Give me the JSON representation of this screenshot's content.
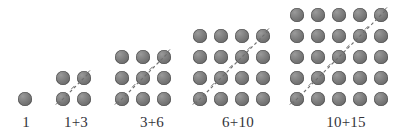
{
  "figure": {
    "background_color": "#ffffff",
    "dot_color": "#7f7f7f",
    "dot_edge_color": "#565656",
    "diagonal_color": "#6f6f6f",
    "label_color": "#33333a",
    "dot_pitch_px": 21,
    "dot_diameter_px": 14,
    "baseline_center_y_px": 99,
    "groups": [
      {
        "index": 1,
        "label": "1",
        "grid_size": 1,
        "dot_count": 1,
        "triangular_parts": [
          1
        ],
        "has_diagonal": false,
        "origin_x": 25,
        "label_left": 10,
        "label_width": 32
      },
      {
        "index": 2,
        "label": "1+3",
        "grid_size": 2,
        "dot_count": 4,
        "triangular_parts": [
          1,
          3
        ],
        "has_diagonal": true,
        "origin_x": 63,
        "label_left": 56,
        "label_width": 40
      },
      {
        "index": 3,
        "label": "3+6",
        "grid_size": 3,
        "dot_count": 9,
        "triangular_parts": [
          3,
          6
        ],
        "has_diagonal": true,
        "origin_x": 122,
        "label_left": 122,
        "label_width": 60
      },
      {
        "index": 4,
        "label": "6+10",
        "grid_size": 4,
        "dot_count": 16,
        "triangular_parts": [
          6,
          10
        ],
        "has_diagonal": true,
        "origin_x": 200,
        "label_left": 196,
        "label_width": 84
      },
      {
        "index": 5,
        "label": "10+15",
        "grid_size": 5,
        "dot_count": 25,
        "triangular_parts": [
          10,
          15
        ],
        "has_diagonal": true,
        "origin_x": 297,
        "label_left": 291,
        "label_width": 110
      }
    ]
  },
  "chart_data": {
    "type": "scatter",
    "xlabel": "",
    "ylabel": "",
    "categories": [
      "1",
      "1+3",
      "3+6",
      "6+10",
      "10+15"
    ],
    "values": [
      1,
      4,
      9,
      16,
      25
    ],
    "series": [
      {
        "name": "square total (n^2)",
        "values": [
          1,
          4,
          9,
          16,
          25
        ]
      },
      {
        "name": "lower triangular part T(n-1)",
        "values": [
          0,
          1,
          3,
          6,
          10
        ]
      },
      {
        "name": "upper triangular part T(n)",
        "values": [
          1,
          3,
          6,
          10,
          15
        ]
      },
      {
        "name": "grid side n",
        "values": [
          1,
          2,
          3,
          4,
          5
        ]
      }
    ],
    "annotations": [
      "Each group of dots is an n by n square array.",
      "A dashed anti-diagonal splits each square into two triangular numbers.",
      "Labels read 1, 1+3, 3+6, 6+10, 10+15 giving 1, 4, 9, 16, 25."
    ],
    "legend_position": "none",
    "grid": false
  }
}
